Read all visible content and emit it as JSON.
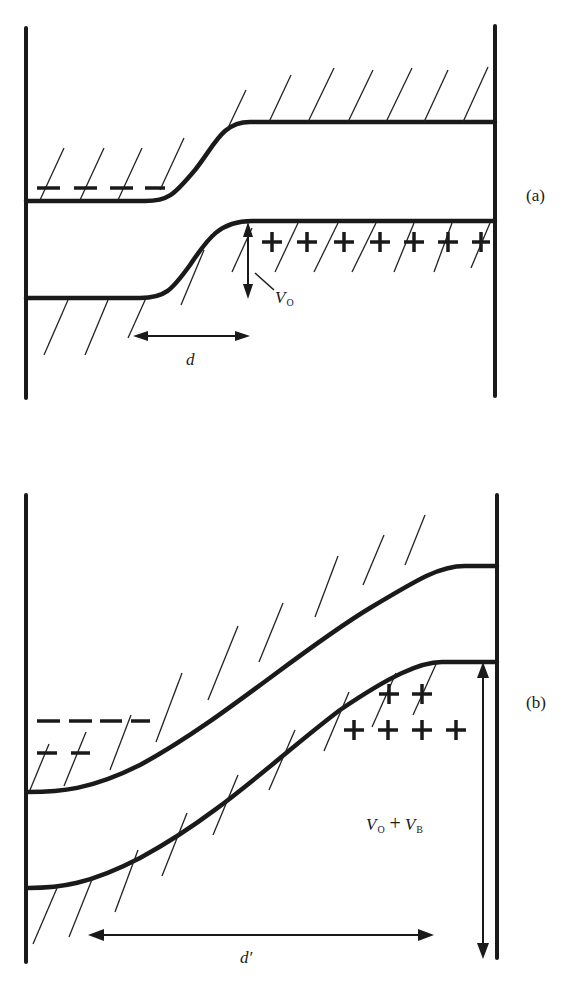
{
  "figure": {
    "type": "energy band diagram of p-n junction",
    "panels": [
      {
        "id": "a",
        "label": "(a)",
        "description": "Junction at equilibrium",
        "negative_charges": "– – – –",
        "positive_charges": "+ + + + + + +",
        "potential_label": {
          "symbol": "V",
          "subscript": "O"
        },
        "width_label": "d"
      },
      {
        "id": "b",
        "label": "(b)",
        "description": "Junction under reverse bias",
        "negative_charges_row1": "– – – –",
        "negative_charges_row2": "– –",
        "positive_charges_row1": "+ +",
        "positive_charges_row2": "+ + + +",
        "potential_label": {
          "symbol1": "V",
          "subscript1": "O",
          "operator": "+",
          "symbol2": "V",
          "subscript2": "B"
        },
        "width_label": "d′"
      }
    ]
  },
  "colors": {
    "ink": "#1a1a1a",
    "background": "#ffffff"
  }
}
